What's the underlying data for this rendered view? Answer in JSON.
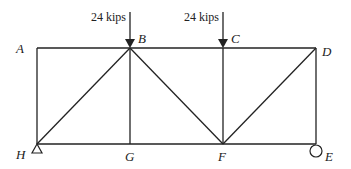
{
  "diagram": {
    "nodes": [
      {
        "id": "A",
        "label": "A",
        "x": 37,
        "y": 48
      },
      {
        "id": "B",
        "label": "B",
        "x": 130,
        "y": 48
      },
      {
        "id": "C",
        "label": "C",
        "x": 223,
        "y": 48
      },
      {
        "id": "D",
        "label": "D",
        "x": 316,
        "y": 48
      },
      {
        "id": "H",
        "label": "H",
        "x": 37,
        "y": 144
      },
      {
        "id": "G",
        "label": "G",
        "x": 130,
        "y": 144
      },
      {
        "id": "F",
        "label": "F",
        "x": 223,
        "y": 144
      },
      {
        "id": "E",
        "label": "E",
        "x": 316,
        "y": 144
      }
    ],
    "members": [
      "AB",
      "BC",
      "CD",
      "HG",
      "GF",
      "FE",
      "AH",
      "BG",
      "CF",
      "DE",
      "HB",
      "BF",
      "FD"
    ],
    "loads": [
      {
        "node": "B",
        "label": "24 kips"
      },
      {
        "node": "C",
        "label": "24 kips"
      }
    ],
    "supports": [
      {
        "node": "H",
        "type": "pin",
        "icon": "triangle-pin-icon"
      },
      {
        "node": "E",
        "type": "roller",
        "icon": "circle-roller-icon"
      }
    ]
  }
}
